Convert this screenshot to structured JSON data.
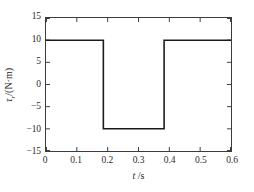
{
  "chart_data": {
    "type": "line",
    "title": "",
    "subtitle": "",
    "xlabel": "t /s",
    "xlabel_italic_part": "t",
    "xlabel_rest": " /s",
    "ylabel": "τr/(N·m)",
    "ylabel_symbol": "τ",
    "ylabel_subscript": "r",
    "ylabel_unit": "/(N·m)",
    "xlim": [
      0,
      0.6
    ],
    "ylim": [
      -15,
      15
    ],
    "xticks": [
      0,
      0.1,
      0.2,
      0.3,
      0.4,
      0.5,
      0.6
    ],
    "xtick_labels": [
      "0",
      "0.1",
      "0.2",
      "0.3",
      "0.4",
      "0.5",
      "0.6"
    ],
    "yticks": [
      -15,
      -10,
      -5,
      0,
      5,
      10,
      15
    ],
    "ytick_labels": [
      "−15",
      "−10",
      "−5",
      "0",
      "5",
      "10",
      "15"
    ],
    "grid": false,
    "legend": null,
    "series": [
      {
        "name": "reference torque",
        "color": "#1a1a1a",
        "linewidth": 1.6,
        "x": [
          0.0,
          0.186,
          0.186,
          0.383,
          0.383,
          0.6
        ],
        "y": [
          10,
          10,
          -10,
          -10,
          10,
          10
        ]
      }
    ],
    "annotations": [],
    "high_level": 10,
    "low_level": -10,
    "fall_time": 0.186,
    "rise_time": 0.383
  },
  "style": {
    "background": "#ffffff",
    "axis_color": "#3c3c3c",
    "text_color": "#1f1f1f",
    "line_color": "#1a1a1a"
  }
}
